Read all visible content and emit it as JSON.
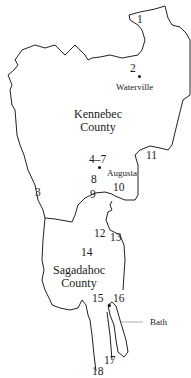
{
  "map": {
    "colors": {
      "boundary": "#222222",
      "leader": "#999999",
      "text": "#1a1a1a",
      "background": "#ffffff"
    },
    "counties": [
      {
        "name_line1": "Kennebec",
        "name_line2": "County"
      },
      {
        "name_line1": "Sagadahoc",
        "name_line2": "County"
      }
    ],
    "towns": [
      {
        "name": "Waterville"
      },
      {
        "name": "Augusta"
      },
      {
        "name": "Bath"
      }
    ],
    "sites": [
      "1",
      "2",
      "3",
      "4–7",
      "8",
      "9",
      "10",
      "11",
      "12",
      "13",
      "14",
      "15",
      "16",
      "17",
      "18"
    ]
  }
}
